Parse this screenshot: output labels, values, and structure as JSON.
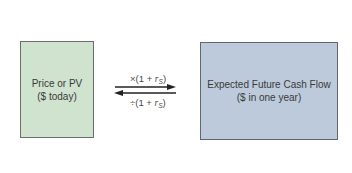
{
  "diagram": {
    "left_node": {
      "line1": "Price or PV",
      "line2": "($ today)",
      "fill_color": "#cfe3cf"
    },
    "right_node": {
      "line1": "Expected Future Cash Flow",
      "line2": "($ in one year)",
      "fill_color": "#bccadb"
    },
    "forward_edge": {
      "direction": "left-to-right",
      "operator": "×",
      "expr_prefix": "(1 + ",
      "rate_symbol": "r",
      "rate_subscript": "S",
      "expr_suffix": ")"
    },
    "backward_edge": {
      "direction": "right-to-left",
      "operator": "÷",
      "expr_prefix": "(1 + ",
      "rate_symbol": "r",
      "rate_subscript": "S",
      "expr_suffix": ")"
    }
  }
}
